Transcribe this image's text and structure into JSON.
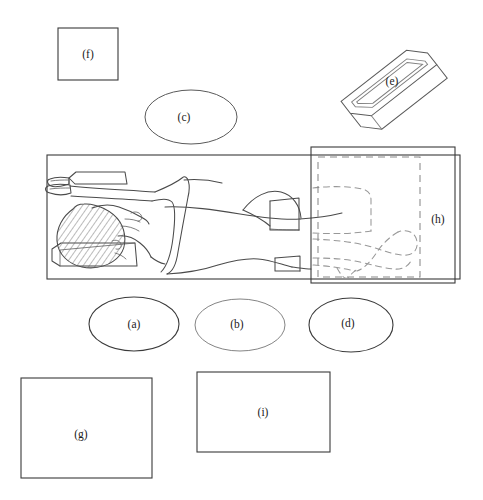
{
  "figure": {
    "title": "",
    "background_color": "#ffffff",
    "line_color": "#3a3a3a",
    "dashed_line_color": "#8a8a8a",
    "width": 483,
    "height": 500
  },
  "labels": {
    "a": "(a)",
    "b": "(b)",
    "c": "(c)",
    "d": "(d)",
    "e": "(e)",
    "f": "(f)",
    "g": "(g)",
    "h": "(h)",
    "i": "(i)"
  },
  "shapes": [
    {
      "id": "f",
      "label": "(f)",
      "kind": "rectangle",
      "x": 58,
      "y": 28,
      "width": 60,
      "height": 52,
      "label_x": 88,
      "label_y": 54
    },
    {
      "id": "c",
      "label": "(c)",
      "kind": "ellipse",
      "cx": 191,
      "cy": 117,
      "rx": 46,
      "ry": 27,
      "label_x": 184,
      "label_y": 117
    },
    {
      "id": "e",
      "label": "(e)",
      "kind": "rotated-box",
      "cx": 392,
      "cy": 87,
      "rotation": -38,
      "label_x": 392,
      "label_y": 81
    },
    {
      "id": "h",
      "label": "(h)",
      "kind": "rectangle-with-dashed-inset",
      "x": 311,
      "y": 147,
      "width": 144,
      "height": 136,
      "label_x": 438,
      "label_y": 219
    },
    {
      "id": "bed",
      "label": "",
      "kind": "rectangle",
      "x": 47,
      "y": 155,
      "width": 413,
      "height": 124,
      "label_x": 0,
      "label_y": 0
    },
    {
      "id": "a",
      "label": "(a)",
      "kind": "ellipse",
      "cx": 134,
      "cy": 324,
      "rx": 45,
      "ry": 27,
      "label_x": 134,
      "label_y": 324
    },
    {
      "id": "b",
      "label": "(b)",
      "kind": "ellipse",
      "cx": 240,
      "cy": 325,
      "rx": 45,
      "ry": 26,
      "label_x": 237,
      "label_y": 324
    },
    {
      "id": "d",
      "label": "(d)",
      "kind": "ellipse",
      "cx": 351,
      "cy": 325,
      "rx": 42,
      "ry": 27,
      "label_x": 348,
      "label_y": 323
    },
    {
      "id": "g",
      "label": "(g)",
      "kind": "rectangle",
      "x": 21,
      "y": 378,
      "width": 131,
      "height": 100,
      "label_x": 81,
      "label_y": 434
    },
    {
      "id": "i",
      "label": "(i)",
      "kind": "rectangle",
      "x": 197,
      "y": 372,
      "width": 133,
      "height": 80,
      "label_x": 263,
      "label_y": 412
    }
  ],
  "illustration": {
    "name": "supine-patient-on-table",
    "description": "Line drawing of a patient lying supine on an examination table with arms raised above the head, head resting on a hatched head support, one knee drawn up, and a dashed outline indicating an alternate leg position",
    "parts": [
      "examination-table",
      "head-support-pillow",
      "hatched-hair",
      "face-profile",
      "raised-arms",
      "hands-overlapping",
      "torso",
      "raised-knee",
      "legs",
      "feet",
      "dashed-alternate-leg-position"
    ]
  }
}
